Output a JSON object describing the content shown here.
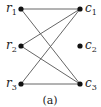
{
  "diagram": {
    "type": "bipartite-graph",
    "caption": "(a)",
    "nodes": [
      {
        "id": "r1",
        "base": "r",
        "sub": "1",
        "x": 21,
        "y": 9,
        "side": "left"
      },
      {
        "id": "r2",
        "base": "r",
        "sub": "2",
        "x": 21,
        "y": 46,
        "side": "left"
      },
      {
        "id": "r3",
        "base": "r",
        "sub": "3",
        "x": 21,
        "y": 84,
        "side": "left"
      },
      {
        "id": "c1",
        "base": "c",
        "sub": "1",
        "x": 80,
        "y": 9,
        "side": "right"
      },
      {
        "id": "c2",
        "base": "c",
        "sub": "2",
        "x": 80,
        "y": 46,
        "side": "right"
      },
      {
        "id": "c3",
        "base": "c",
        "sub": "3",
        "x": 80,
        "y": 84,
        "side": "right"
      }
    ],
    "edges": [
      [
        "r1",
        "c1"
      ],
      [
        "r1",
        "c3"
      ],
      [
        "r2",
        "c1"
      ],
      [
        "r2",
        "c3"
      ],
      [
        "r3",
        "c1"
      ],
      [
        "r3",
        "c3"
      ]
    ],
    "colors": {
      "node": "#111111",
      "edge": "#555555",
      "text": "#222222"
    }
  }
}
